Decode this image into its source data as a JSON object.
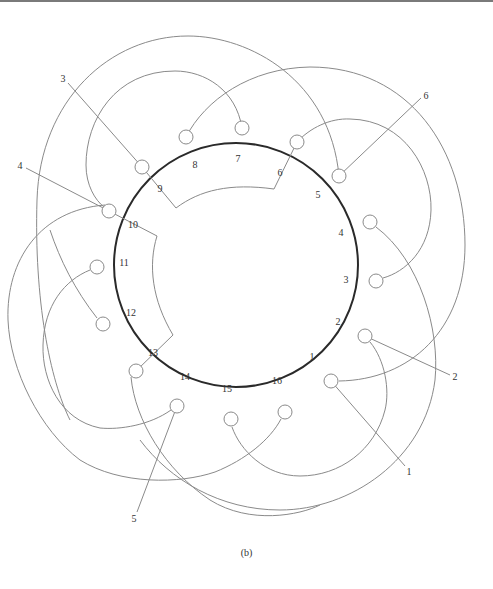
{
  "figure": {
    "caption": "(b)",
    "stator": {
      "cx": 236,
      "cy": 265,
      "r": 122
    },
    "slot_labels": [
      {
        "text": "1",
        "x": 312,
        "y": 358
      },
      {
        "text": "2",
        "x": 338,
        "y": 323
      },
      {
        "text": "3",
        "x": 346,
        "y": 281
      },
      {
        "text": "4",
        "x": 341,
        "y": 234
      },
      {
        "text": "5",
        "x": 318,
        "y": 196
      },
      {
        "text": "6",
        "x": 280,
        "y": 174
      },
      {
        "text": "7",
        "x": 238,
        "y": 160
      },
      {
        "text": "8",
        "x": 195,
        "y": 166
      },
      {
        "text": "9",
        "x": 160,
        "y": 190
      },
      {
        "text": "10",
        "x": 133,
        "y": 226
      },
      {
        "text": "11",
        "x": 124,
        "y": 264
      },
      {
        "text": "12",
        "x": 131,
        "y": 314
      },
      {
        "text": "13",
        "x": 153,
        "y": 354
      },
      {
        "text": "14",
        "x": 185,
        "y": 378
      },
      {
        "text": "15",
        "x": 227,
        "y": 390
      },
      {
        "text": "16",
        "x": 277,
        "y": 382
      }
    ],
    "lead_labels": [
      {
        "text": "1",
        "x": 409,
        "y": 473
      },
      {
        "text": "2",
        "x": 455,
        "y": 378
      },
      {
        "text": "3",
        "x": 63,
        "y": 80
      },
      {
        "text": "4",
        "x": 20,
        "y": 167
      },
      {
        "text": "5",
        "x": 134,
        "y": 520
      },
      {
        "text": "6",
        "x": 426,
        "y": 97
      }
    ]
  }
}
